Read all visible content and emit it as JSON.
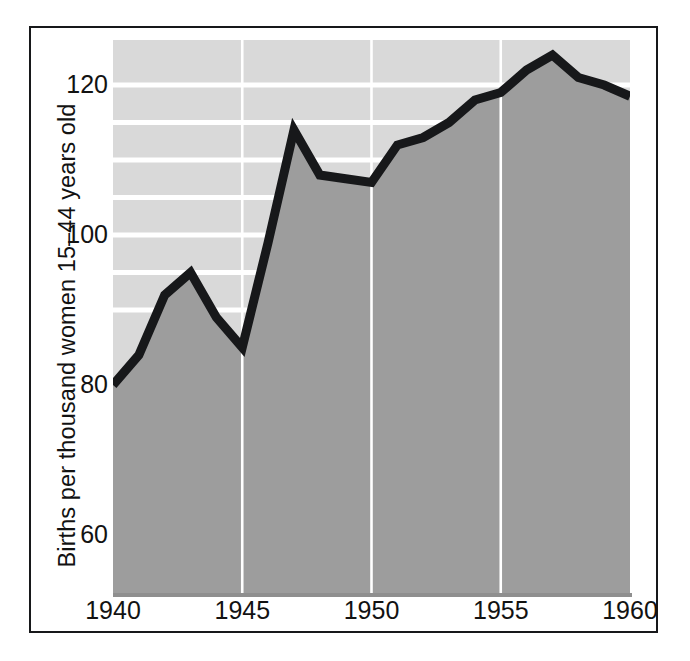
{
  "chart_data": {
    "type": "area",
    "title": "",
    "subtitle": "",
    "xlabel": "",
    "ylabel": "Births per thousand women 15–44 years old",
    "x": [
      1940,
      1941,
      1942,
      1943,
      1944,
      1945,
      1946,
      1947,
      1948,
      1949,
      1950,
      1951,
      1952,
      1953,
      1954,
      1955,
      1956,
      1957,
      1958,
      1959,
      1960
    ],
    "values": [
      80,
      84,
      92,
      95,
      89,
      85,
      99,
      114,
      108,
      107.5,
      107,
      112,
      113,
      115,
      118,
      119,
      122,
      124,
      121,
      120,
      118.5
    ],
    "series": [
      {
        "name": "Births per thousand women 15-44 years old",
        "values": [
          80,
          84,
          92,
          95,
          89,
          85,
          99,
          114,
          108,
          107.5,
          107,
          112,
          113,
          115,
          118,
          119,
          122,
          124,
          121,
          120,
          118.5
        ]
      }
    ],
    "xlim": [
      1940,
      1960
    ],
    "ylim": [
      52,
      126
    ],
    "ytick_labels": [
      "120",
      "100",
      "80",
      "60"
    ],
    "ytick_values": [
      120,
      100,
      80,
      60
    ],
    "xtick_labels": [
      "1940",
      "1945",
      "1950",
      "1955",
      "1960"
    ],
    "xtick_values": [
      1940,
      1945,
      1950,
      1955,
      1960
    ],
    "grid": {
      "horizontal": true,
      "horizontal_values": [
        120,
        115,
        110,
        105,
        100,
        95,
        90
      ],
      "vertical": true,
      "vertical_values": [
        1945,
        1950,
        1955
      ]
    },
    "legend": null,
    "legend_position": "none",
    "annotations": []
  },
  "style": {
    "line_color": "#17181a",
    "area_fill_color": "#9d9d9d",
    "plot_background_color": "#d9d9d9",
    "gridline_color": "#ffffff",
    "frame_color": "#17181a",
    "text_color": "#121212",
    "page_background_color": "#ffffff"
  },
  "axes": {
    "y_title": "Births per thousand women 15–44 years old",
    "y_ticks": [
      {
        "label": "120",
        "value": 120
      },
      {
        "label": "100",
        "value": 100
      },
      {
        "label": "80",
        "value": 80
      },
      {
        "label": "60",
        "value": 60
      }
    ],
    "x_ticks": [
      {
        "label": "1940",
        "value": 1940
      },
      {
        "label": "1945",
        "value": 1945
      },
      {
        "label": "1950",
        "value": 1950
      },
      {
        "label": "1955",
        "value": 1955
      },
      {
        "label": "1960",
        "value": 1960
      }
    ]
  }
}
